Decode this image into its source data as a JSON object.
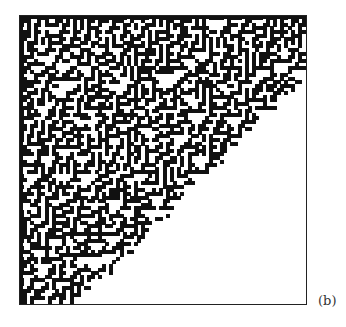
{
  "figure": {
    "panel_label": "(b)",
    "colors": {
      "cell_on": "#111111",
      "cell_off": "#ffffff",
      "frame": "#222222",
      "label": "#333333"
    },
    "grid": {
      "columns": 80,
      "rows": 80,
      "cell_px": 3.6
    },
    "boundary": {
      "type": "diagonal",
      "filled_region": "upper-left triangle",
      "right_edge_y_fraction": 0.21,
      "bottom_edge_x_fraction": 0.2
    }
  }
}
